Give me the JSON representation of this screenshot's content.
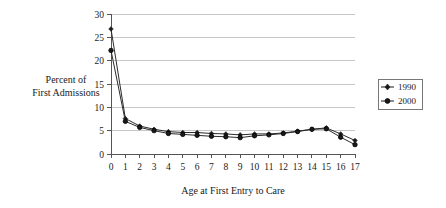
{
  "chart_data": {
    "type": "line",
    "title": "",
    "xlabel": "Age at First Entry to Care",
    "ylabel": "Percent of First Admissions",
    "ylabel_line1": "Percent of",
    "ylabel_line2": "First Admissions",
    "x": [
      0,
      1,
      2,
      3,
      4,
      5,
      6,
      7,
      8,
      9,
      10,
      11,
      12,
      13,
      14,
      15,
      16,
      17
    ],
    "categories": [
      "0",
      "1",
      "2",
      "3",
      "4",
      "5",
      "6",
      "7",
      "8",
      "9",
      "10",
      "11",
      "12",
      "13",
      "14",
      "15",
      "16",
      "17"
    ],
    "xlim": [
      0,
      17
    ],
    "ylim": [
      0,
      30
    ],
    "yticks": [
      0,
      5,
      10,
      15,
      20,
      25,
      30
    ],
    "ytick_labels": [
      "0",
      "5",
      "10",
      "15",
      "20",
      "25",
      "30"
    ],
    "grid": true,
    "legend_position": "right",
    "series": [
      {
        "name": "1990",
        "marker": "diamond",
        "color": "#1a1a1a",
        "values": [
          26.8,
          7.6,
          6.0,
          5.3,
          4.8,
          4.6,
          4.6,
          4.4,
          4.3,
          4.1,
          4.3,
          4.3,
          4.5,
          4.9,
          5.3,
          5.6,
          4.3,
          2.9
        ]
      },
      {
        "name": "2000",
        "marker": "circle",
        "color": "#1a1a1a",
        "values": [
          22.2,
          7.0,
          5.7,
          5.0,
          4.4,
          4.2,
          4.0,
          3.8,
          3.7,
          3.5,
          3.9,
          4.1,
          4.4,
          4.8,
          5.3,
          5.4,
          3.6,
          2.0
        ]
      }
    ]
  },
  "legend": {
    "entries": [
      {
        "label": "1990"
      },
      {
        "label": "2000"
      }
    ]
  },
  "colors": {
    "axis": "#555555",
    "grid": "#b9b9b9",
    "series": "#1a1a1a",
    "background": "#ffffff"
  }
}
